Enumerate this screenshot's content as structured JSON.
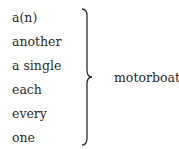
{
  "diagram": {
    "left_items": [
      "a(n)",
      "another",
      "a single",
      "each",
      "every",
      "one"
    ],
    "right_item": "motorboat",
    "connector": "right-curly-brace"
  }
}
